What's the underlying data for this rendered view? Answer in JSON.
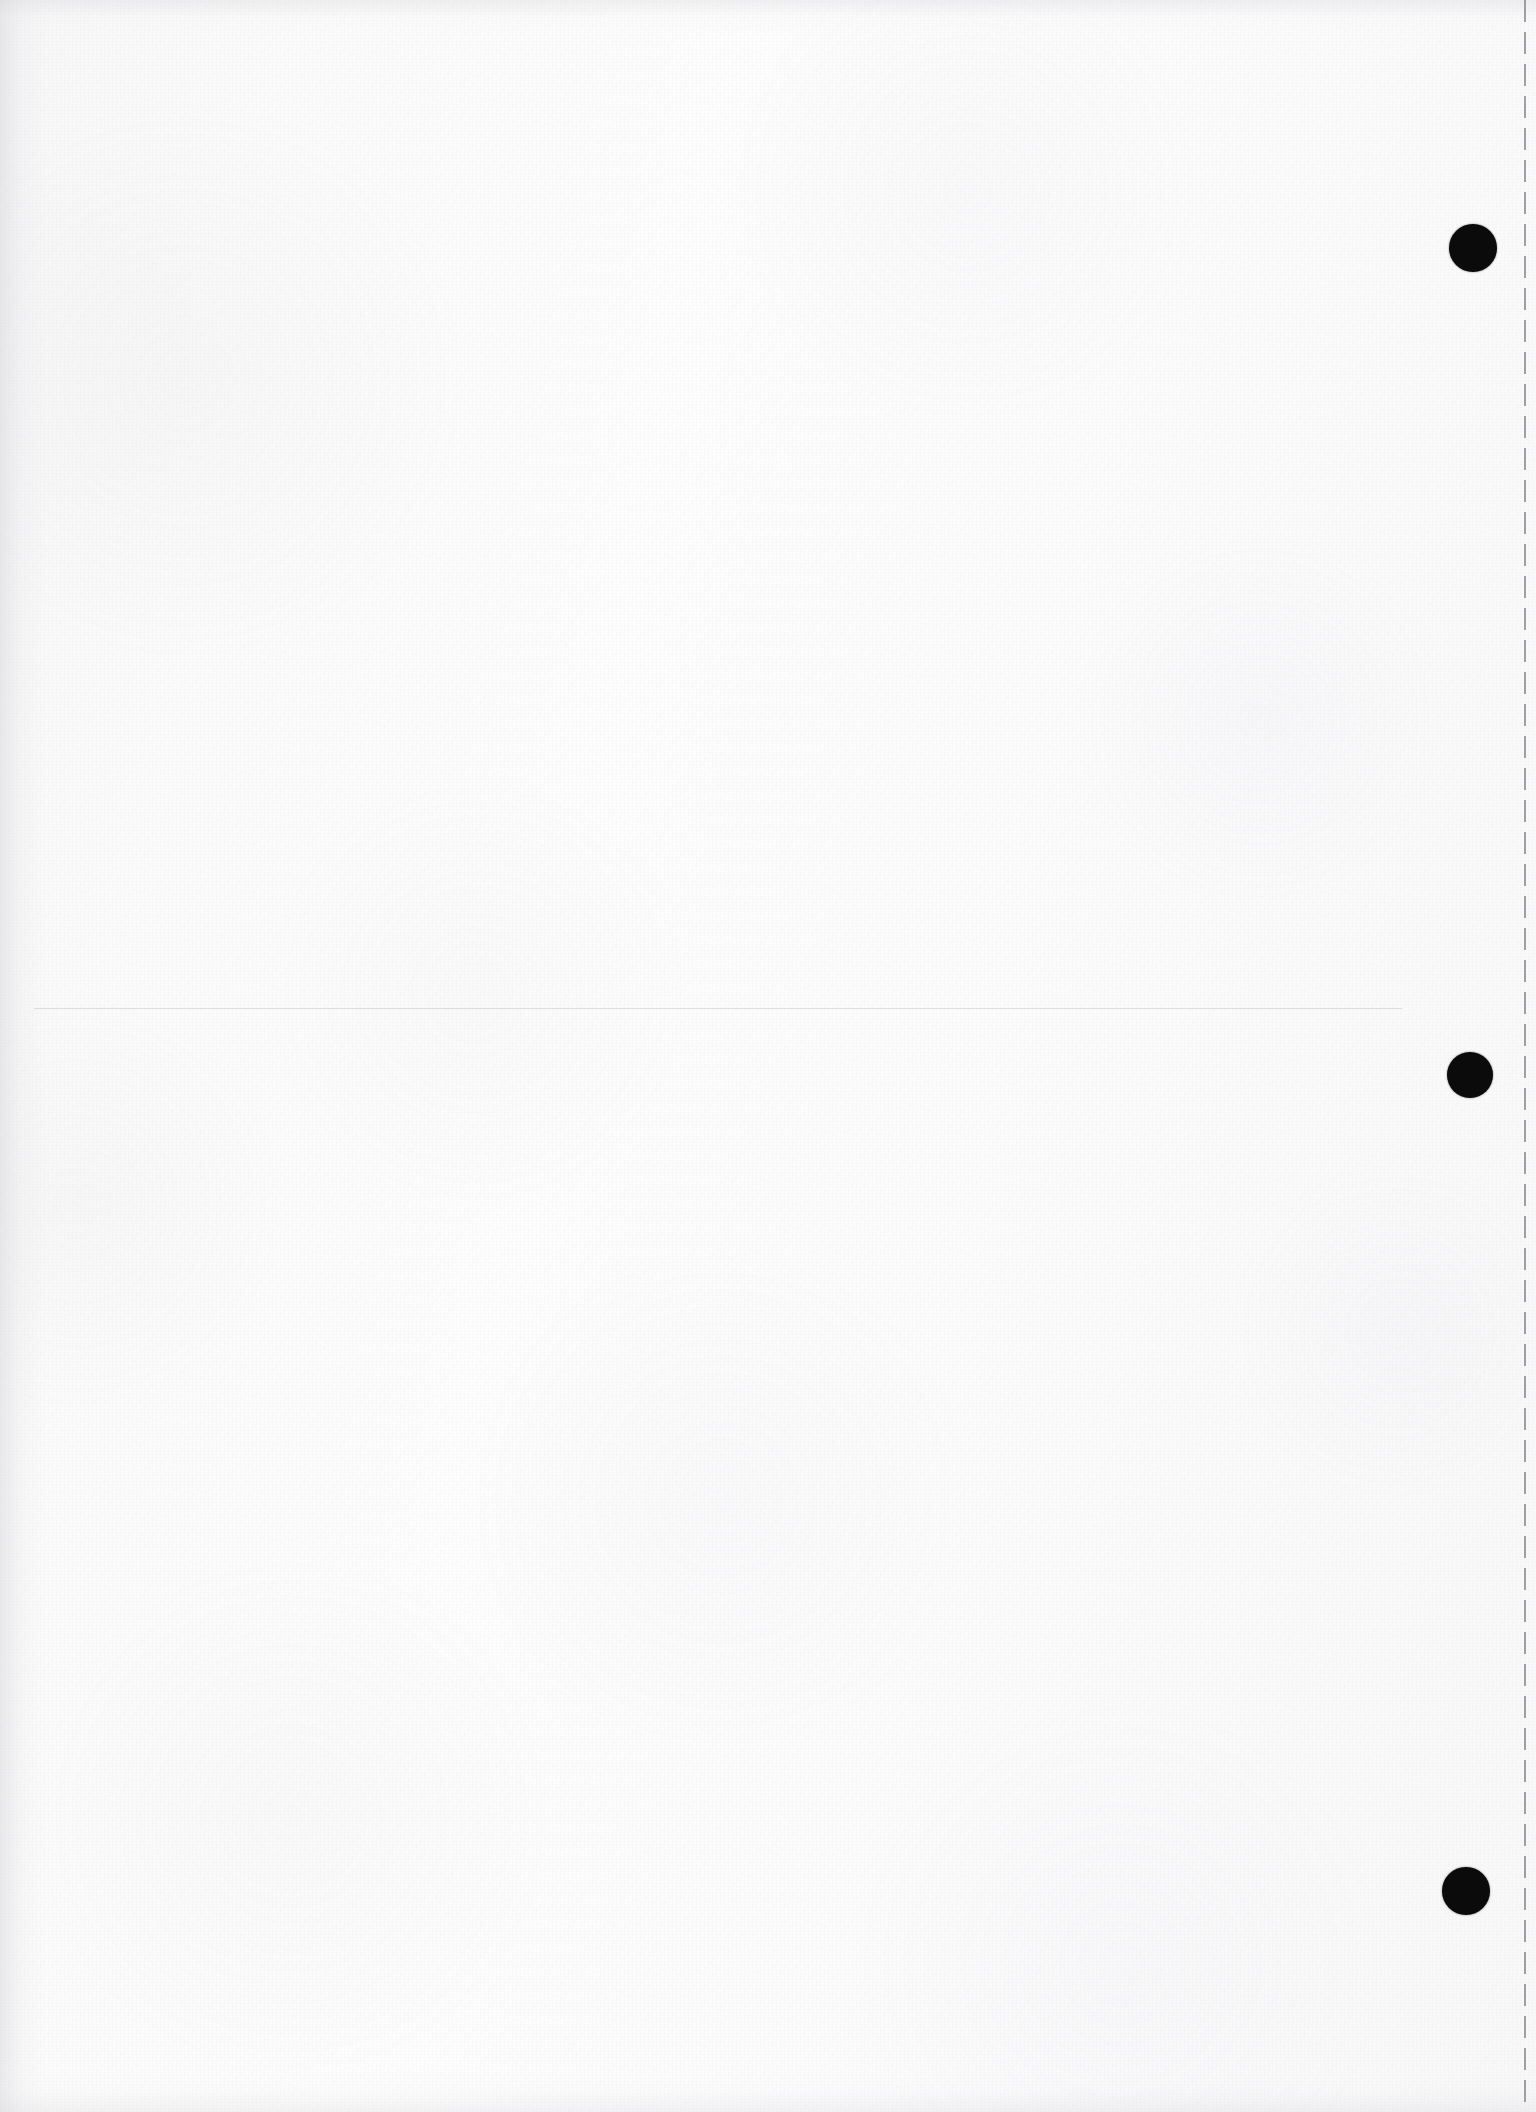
{
  "document": {
    "kind": "scanned-blank-page",
    "orientation": "portrait",
    "width_px": 1536,
    "height_px": 2112,
    "page_color": "#fcfcfc",
    "ink_color": "#0b0b0c",
    "visible_text": "",
    "notes_label": ""
  },
  "marks": {
    "punch_marks": [
      {
        "name": "punch-mark-top",
        "cx": 1473,
        "cy": 248,
        "r": 24
      },
      {
        "name": "punch-mark-middle",
        "cx": 1470,
        "cy": 1075,
        "r": 23
      },
      {
        "name": "punch-mark-bottom",
        "cx": 1466,
        "cy": 1891,
        "r": 24
      }
    ],
    "trim_guide": {
      "name": "trim-guide-right",
      "x": 1524,
      "dash_length_px": 22,
      "gap_length_px": 10,
      "width_px": 2,
      "color": "#8f8f97"
    },
    "faint_rule": {
      "name": "faint-horizontal-rule",
      "y": 1008,
      "x_start": 34,
      "x_end": 1402,
      "color": "#b2b4bc"
    }
  }
}
